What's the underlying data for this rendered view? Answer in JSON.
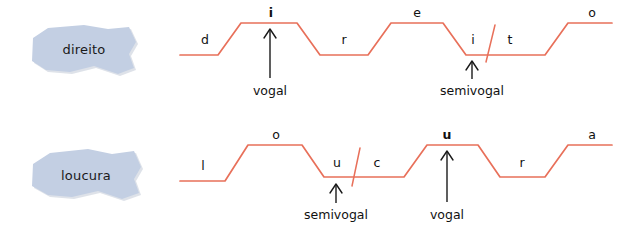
{
  "figure": {
    "title_present": false,
    "background_color": "#ffffff",
    "contour_color": "#e8705a",
    "blob_fill_color": "#c3cfe3",
    "text_color": "#111111"
  },
  "rows": [
    {
      "id": "row-direito",
      "word": "direito",
      "segments": [
        {
          "label": "d",
          "bold": false,
          "level": "low"
        },
        {
          "label": "i",
          "bold": true,
          "level": "high"
        },
        {
          "label": "r",
          "bold": false,
          "level": "low"
        },
        {
          "label": "e",
          "bold": false,
          "level": "high"
        },
        {
          "label": "i",
          "bold": false,
          "level": "low"
        },
        {
          "label": "t",
          "bold": false,
          "level": "low"
        },
        {
          "label": "o",
          "bold": false,
          "level": "high"
        }
      ],
      "annotations": [
        {
          "text": "vogal",
          "points_to": "i"
        },
        {
          "text": "semivogal",
          "points_to": "i"
        }
      ],
      "syllable_break_present": true
    },
    {
      "id": "row-loucura",
      "word": "loucura",
      "segments": [
        {
          "label": "l",
          "bold": false,
          "level": "low"
        },
        {
          "label": "o",
          "bold": false,
          "level": "high"
        },
        {
          "label": "u",
          "bold": false,
          "level": "low"
        },
        {
          "label": "c",
          "bold": false,
          "level": "low"
        },
        {
          "label": "u",
          "bold": true,
          "level": "high"
        },
        {
          "label": "r",
          "bold": false,
          "level": "low"
        },
        {
          "label": "a",
          "bold": false,
          "level": "high"
        }
      ],
      "annotations": [
        {
          "text": "semivogal",
          "points_to": "u"
        },
        {
          "text": "vogal",
          "points_to": "u"
        }
      ],
      "syllable_break_present": true
    }
  ]
}
